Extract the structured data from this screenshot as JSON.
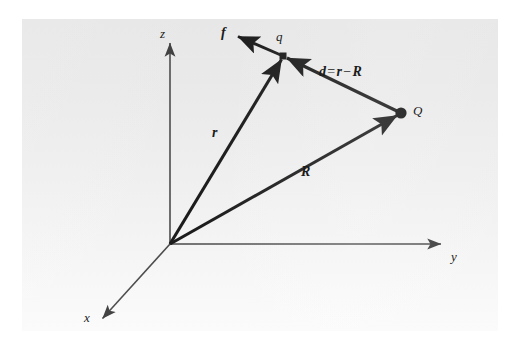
{
  "figure": {
    "kind": "vector-diagram",
    "panel": {
      "background_top": "#e7e7e7",
      "background_bottom": "#fbfbfb",
      "stroke_color": "#1b1b1b",
      "axis_color": "#4a4a4a"
    },
    "axes": [
      {
        "id": "x",
        "label": "x",
        "label_x": 64,
        "label_y": 299,
        "from": [
          148,
          225
        ],
        "to": [
          79,
          301
        ]
      },
      {
        "id": "y",
        "label": "y",
        "label_x": 430,
        "label_y": 238,
        "from": [
          148,
          225
        ],
        "to": [
          421,
          225
        ]
      },
      {
        "id": "z",
        "label": "z",
        "label_x": 139,
        "label_y": 14,
        "from": [
          148,
          225
        ],
        "to": [
          148,
          22
        ]
      }
    ],
    "points": [
      {
        "id": "q",
        "label": "q",
        "x": 261,
        "y": 37,
        "label_x": 254,
        "label_y": 17,
        "dot": false
      },
      {
        "id": "Q",
        "label": "Q",
        "x": 379,
        "y": 94,
        "label_x": 392,
        "label_y": 85,
        "dot": true,
        "dot_radius": 5.5
      }
    ],
    "vectors": [
      {
        "id": "r",
        "label": "r",
        "from": [
          148,
          225
        ],
        "to": [
          261,
          37
        ],
        "label_x": 192,
        "label_y": 113,
        "arrow": true
      },
      {
        "id": "R",
        "label": "R",
        "from": [
          148,
          225
        ],
        "to": [
          379,
          94
        ],
        "label_x": 281,
        "label_y": 152,
        "arrow": true
      },
      {
        "id": "d",
        "label": "d",
        "from": [
          379,
          94
        ],
        "to": [
          261,
          37
        ],
        "label_x": 0,
        "label_y": 0,
        "arrow": true
      },
      {
        "id": "f",
        "label": "f",
        "from": [
          261,
          37
        ],
        "to": [
          213,
          16
        ],
        "label_x": 201,
        "label_y": 12,
        "arrow": true
      }
    ],
    "equation": {
      "text": "d = r − R",
      "lhs": "d",
      "equals": "=",
      "rhs_first": "r",
      "minus": "−",
      "rhs_second": "R",
      "label_x": 299,
      "label_y": 52
    }
  }
}
